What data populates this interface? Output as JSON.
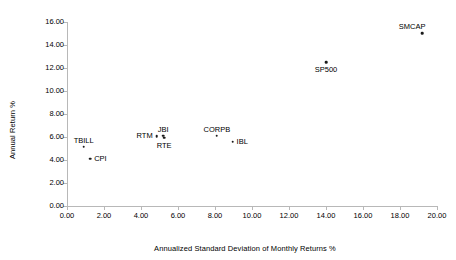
{
  "chart_data": {
    "type": "scatter",
    "title": "",
    "xlabel": "Annualized Standard Deviation of Monthly Returns %",
    "ylabel": "Annual Return %",
    "xlim": [
      0,
      20
    ],
    "ylim": [
      0,
      16
    ],
    "xticks": [
      "0.00",
      "2.00",
      "4.00",
      "6.00",
      "8.00",
      "10.00",
      "12.00",
      "14.00",
      "16.00",
      "18.00",
      "20.00"
    ],
    "yticks": [
      "0.00",
      "2.00",
      "4.00",
      "6.00",
      "8.00",
      "10.00",
      "12.00",
      "14.00",
      "16.00"
    ],
    "xtick_values": [
      0,
      2,
      4,
      6,
      8,
      10,
      12,
      14,
      16,
      18,
      20
    ],
    "ytick_values": [
      0,
      2,
      4,
      6,
      8,
      10,
      12,
      14,
      16
    ],
    "grid": false,
    "legend": "none",
    "marker_color": "#1a1a1a",
    "axis_color": "#b8b8b8",
    "points": [
      {
        "label": "TBILL",
        "x": 0.9,
        "y": 5.15,
        "label_pos": "above"
      },
      {
        "label": "CPI",
        "x": 1.25,
        "y": 4.1,
        "label_pos": "right"
      },
      {
        "label": "RTM",
        "x": 4.85,
        "y": 6.05,
        "label_pos": "left"
      },
      {
        "label": "JBI",
        "x": 5.2,
        "y": 6.1,
        "label_pos": "above"
      },
      {
        "label": "RTE",
        "x": 5.25,
        "y": 5.95,
        "label_pos": "below"
      },
      {
        "label": "CORPB",
        "x": 8.1,
        "y": 6.1,
        "label_pos": "above"
      },
      {
        "label": "IBL",
        "x": 8.95,
        "y": 5.6,
        "label_pos": "right"
      },
      {
        "label": "SP500",
        "x": 14.0,
        "y": 12.5,
        "label_pos": "below"
      },
      {
        "label": "SMCAP",
        "x": 19.2,
        "y": 15.05,
        "label_pos": "above-left"
      }
    ]
  }
}
